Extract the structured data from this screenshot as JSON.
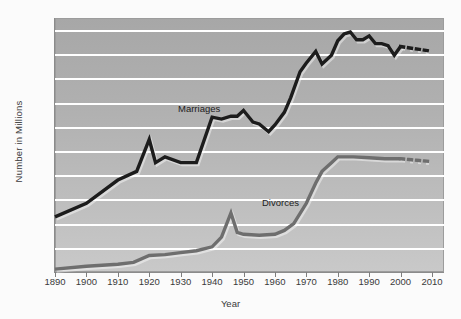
{
  "chart_data": {
    "type": "line",
    "title": "",
    "xlabel": "Year",
    "ylabel": "Number in Millions",
    "xlim": [
      1890,
      2010
    ],
    "ylim": [
      0.0,
      2.625
    ],
    "grid": true,
    "legend_position": "inline-annotation",
    "xticks": [
      "1890",
      "1900",
      "1910",
      "1920",
      "1930",
      "1940",
      "1950",
      "1960",
      "1970",
      "1980",
      "1990",
      "2000",
      "2010"
    ],
    "xtick_values": [
      1890,
      1900,
      1910,
      1920,
      1930,
      1940,
      1950,
      1960,
      1970,
      1980,
      1990,
      2000,
      2010
    ],
    "yticks": [
      ".00",
      ".25",
      ".50",
      ".75",
      "1.0",
      "1.25",
      "1.50",
      "1.75",
      "2.0",
      "2.25",
      "2.50"
    ],
    "ytick_values": [
      0.0,
      0.25,
      0.5,
      0.75,
      1.0,
      1.25,
      1.5,
      1.75,
      2.0,
      2.25,
      2.5
    ],
    "series": [
      {
        "name": "Marriages",
        "color": "#1c1c1c",
        "x": [
          1890,
          1900,
          1910,
          1916,
          1920,
          1922,
          1925,
          1930,
          1935,
          1940,
          1943,
          1946,
          1948,
          1950,
          1953,
          1955,
          1958,
          1960,
          1963,
          1965,
          1968,
          1970,
          1973,
          1975,
          1978,
          1980,
          1982,
          1984,
          1986,
          1988,
          1990,
          1992,
          1994,
          1996,
          1998,
          2000
        ],
        "values": [
          0.57,
          0.71,
          0.95,
          1.04,
          1.37,
          1.13,
          1.19,
          1.13,
          1.13,
          1.6,
          1.58,
          1.61,
          1.61,
          1.67,
          1.55,
          1.53,
          1.45,
          1.52,
          1.65,
          1.8,
          2.07,
          2.16,
          2.28,
          2.15,
          2.24,
          2.39,
          2.46,
          2.48,
          2.4,
          2.4,
          2.44,
          2.36,
          2.36,
          2.34,
          2.24,
          2.33
        ]
      },
      {
        "name": "Marriages (projected)",
        "color": "#1c1c1c",
        "style": "dotted",
        "x": [
          2000,
          2010
        ],
        "values": [
          2.33,
          2.28
        ]
      },
      {
        "name": "Divorces",
        "color": "#6e6e6e",
        "x": [
          1890,
          1900,
          1910,
          1915,
          1920,
          1925,
          1930,
          1935,
          1940,
          1943,
          1946,
          1948,
          1950,
          1955,
          1960,
          1963,
          1966,
          1970,
          1973,
          1975,
          1978,
          1980,
          1985,
          1990,
          1995,
          2000
        ],
        "values": [
          0.03,
          0.06,
          0.08,
          0.1,
          0.17,
          0.18,
          0.2,
          0.22,
          0.26,
          0.36,
          0.61,
          0.41,
          0.39,
          0.38,
          0.39,
          0.43,
          0.5,
          0.71,
          0.92,
          1.04,
          1.13,
          1.19,
          1.19,
          1.18,
          1.17,
          1.17
        ]
      },
      {
        "name": "Divorces (projected)",
        "color": "#6e6e6e",
        "style": "dotted",
        "x": [
          2000,
          2010
        ],
        "values": [
          1.17,
          1.14
        ]
      }
    ],
    "annotations": [
      {
        "text": "Marriages",
        "x": 1935,
        "y": 1.72
      },
      {
        "text": "Divorces",
        "x": 1964,
        "y": 0.78
      }
    ]
  }
}
